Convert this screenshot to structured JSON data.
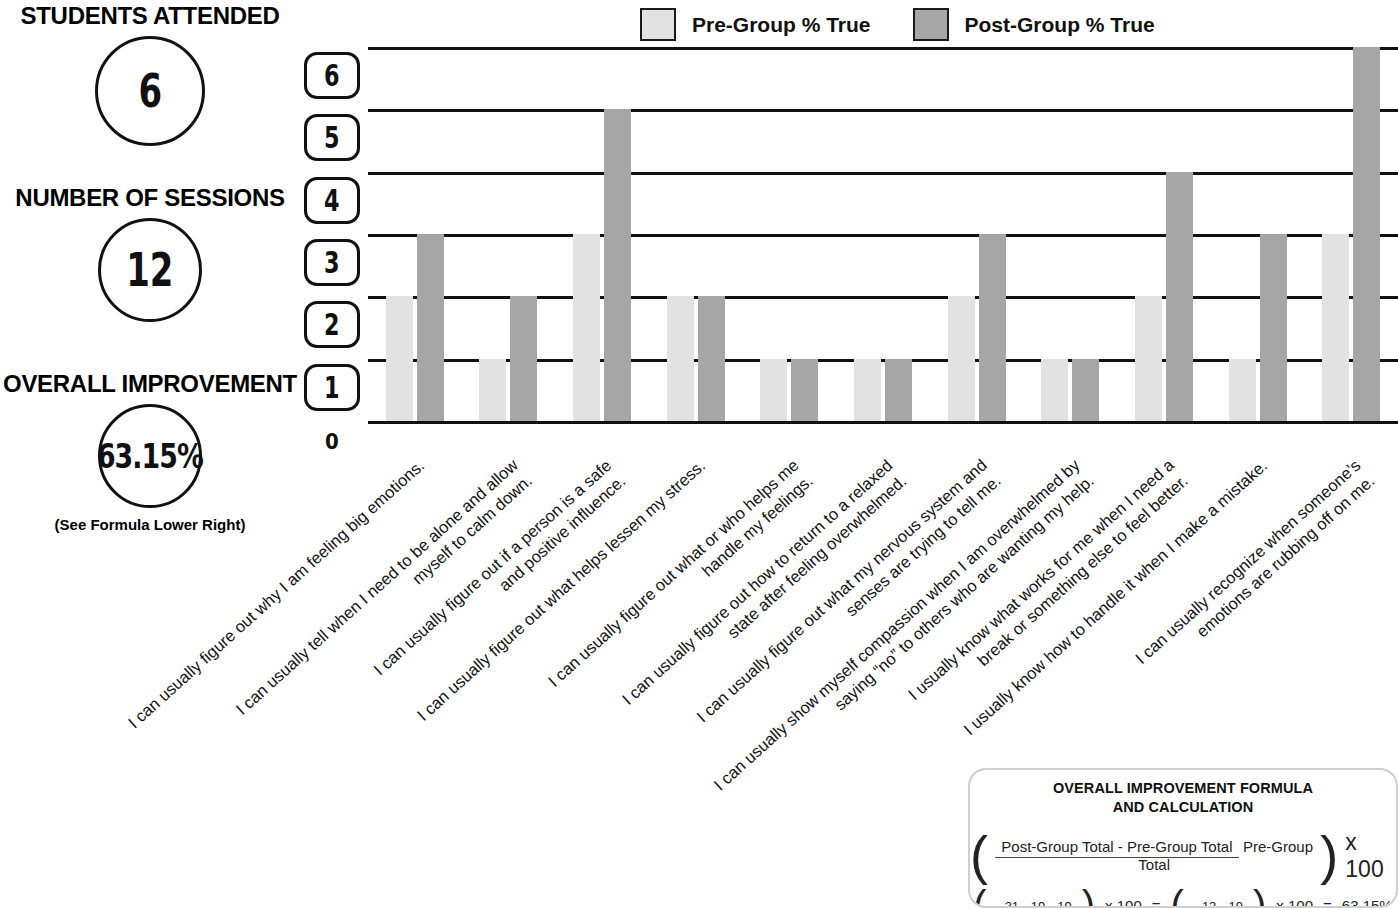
{
  "stats": [
    {
      "title": "STUDENTS ATTENDED",
      "value": "6",
      "note": ""
    },
    {
      "title": "NUMBER OF SESSIONS",
      "value": "12",
      "note": ""
    },
    {
      "title": "OVERALL IMPROVEMENT",
      "value": "63.15%",
      "note": "(See Formula Lower Right)"
    }
  ],
  "legend": [
    {
      "label": "Pre-Group % True",
      "color": "#e2e2e2"
    },
    {
      "label": "Post-Group % True",
      "color": "#a6a6a6"
    }
  ],
  "y_axis": {
    "ticks": [
      "6",
      "5",
      "4",
      "3",
      "2",
      "1"
    ],
    "zero": "0"
  },
  "formula": {
    "title_line1": "OVERALL IMPROVEMENT FORMULA",
    "title_line2": "AND CALCULATION",
    "numerator": "Post-Group Total - Pre-Group Total",
    "denominator": "Pre-Group Total",
    "multiplier": "x 100",
    "calc_numerator": "31 - 19",
    "calc_denominator": "19",
    "calc_multiplier": "x 100",
    "calc_equals": "=",
    "calc_result_numerator": "12",
    "calc_result_denominator": "19",
    "calc_result": "63.15%"
  },
  "chart_data": {
    "type": "bar",
    "title": "",
    "xlabel": "",
    "ylabel": "",
    "ylim": [
      0,
      6
    ],
    "yticks": [
      0,
      1,
      2,
      3,
      4,
      5,
      6
    ],
    "grid": true,
    "legend_position": "top",
    "categories": [
      [
        "I can usually figure out why I am feeling big emotions."
      ],
      [
        "I can usually tell when I need to be alone and allow",
        "myself to calm down."
      ],
      [
        "I can usually figure out if a person is a safe",
        "and positive influence."
      ],
      [
        "I can usually figure out what helps lessen my stress."
      ],
      [
        "I can usually figure out what or who helps me",
        "handle my feelings."
      ],
      [
        "I can usually figure out how to return to a relaxed",
        "state after feeling overwhelmed."
      ],
      [
        "I can usually figure out what my nervous system and",
        "senses are trying to tell me."
      ],
      [
        "I can usually show myself compassion when I am overwhelmed by",
        "saying “no” to others who are wanting my help."
      ],
      [
        "I usually know what works for me when I need a",
        "break or something else to feel better."
      ],
      [
        "I usually know how to handle it when I make a mistake."
      ],
      [
        "I can usually recognize when someone’s",
        "emotions are rubbing off on me."
      ]
    ],
    "series": [
      {
        "name": "Pre-Group % True",
        "color": "#e2e2e2",
        "values": [
          2,
          1,
          3,
          2,
          1,
          1,
          2,
          1,
          2,
          1,
          3
        ],
        "total": 19
      },
      {
        "name": "Post-Group % True",
        "color": "#a6a6a6",
        "values": [
          3,
          2,
          5,
          2,
          1,
          1,
          3,
          1,
          4,
          3,
          6
        ],
        "total": 31
      }
    ]
  }
}
